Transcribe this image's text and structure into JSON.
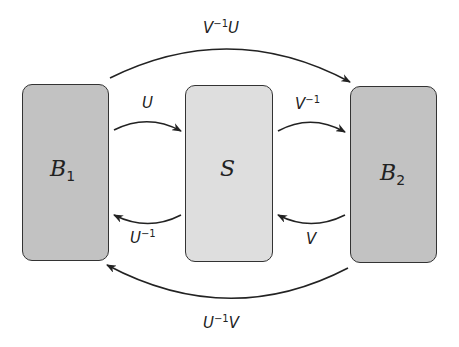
{
  "diagram": {
    "nodes": [
      {
        "id": "B1",
        "symbol": "B",
        "subscript": "1",
        "fill": "#c2c2c2"
      },
      {
        "id": "S",
        "symbol": "S",
        "subscript": "",
        "fill": "#dedede"
      },
      {
        "id": "B2",
        "symbol": "B",
        "subscript": "2",
        "fill": "#c2c2c2"
      }
    ],
    "edges": [
      {
        "from": "B1",
        "to": "B2",
        "label_base": "V",
        "label_sup": "−1",
        "label_tail": "U"
      },
      {
        "from": "B1",
        "to": "S",
        "label_base": "U",
        "label_sup": "",
        "label_tail": ""
      },
      {
        "from": "S",
        "to": "B1",
        "label_base": "U",
        "label_sup": "−1",
        "label_tail": ""
      },
      {
        "from": "S",
        "to": "B2",
        "label_base": "V",
        "label_sup": "−1",
        "label_tail": ""
      },
      {
        "from": "B2",
        "to": "S",
        "label_base": "V",
        "label_sup": "",
        "label_tail": ""
      },
      {
        "from": "B2",
        "to": "B1",
        "label_base": "U",
        "label_sup": "−1",
        "label_tail": "V"
      }
    ]
  }
}
